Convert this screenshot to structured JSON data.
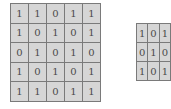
{
  "input_matrix": {
    "rows": [
      [
        "1",
        "1",
        "0",
        "1",
        "1"
      ],
      [
        "1",
        "0",
        "1",
        "0",
        "1"
      ],
      [
        "0",
        "1",
        "0",
        "1",
        "0"
      ],
      [
        "1",
        "0",
        "1",
        "0",
        "1"
      ],
      [
        "1",
        "1",
        "0",
        "1",
        "1"
      ]
    ]
  },
  "kernel_matrix": {
    "rows": [
      [
        "1",
        "0",
        "1"
      ],
      [
        "0",
        "1",
        "0"
      ],
      [
        "1",
        "0",
        "1"
      ]
    ]
  }
}
